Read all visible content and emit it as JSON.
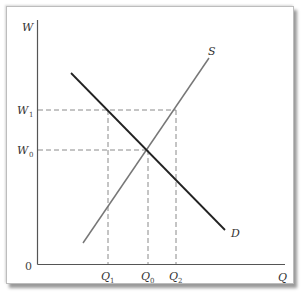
{
  "diagram": {
    "type": "supply-demand",
    "axes": {
      "y_label": "W",
      "x_label": "Q",
      "origin_label": "0"
    },
    "y_ticks": [
      {
        "base": "W",
        "sub": "1",
        "label": "W1"
      },
      {
        "base": "W",
        "sub": "0",
        "label": "W0"
      }
    ],
    "x_ticks": [
      {
        "base": "Q",
        "sub": "1",
        "label": "Q1"
      },
      {
        "base": "Q",
        "sub": "0",
        "label": "Q0"
      },
      {
        "base": "Q",
        "sub": "2",
        "label": "Q2"
      }
    ],
    "curves": [
      {
        "name": "S",
        "label": "S",
        "color": "#777777"
      },
      {
        "name": "D",
        "label": "D",
        "color": "#222222"
      }
    ],
    "colors": {
      "axis": "#555555",
      "dashed": "#888888",
      "supply": "#777777",
      "demand": "#222222"
    }
  }
}
